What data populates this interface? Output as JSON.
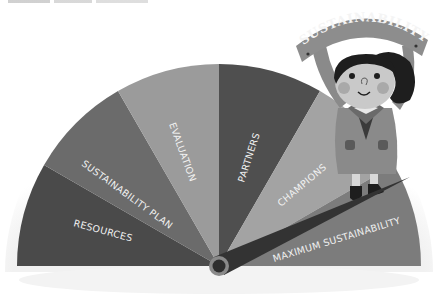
{
  "gauge": {
    "center": [
      219,
      266
    ],
    "radius": 202,
    "needle_angle_deg": 25,
    "sectors": [
      {
        "label": "RESOURCES",
        "color": "#4a4a4a"
      },
      {
        "label": "SUSTAINABILITY PLAN",
        "color": "#6b6b6b"
      },
      {
        "label": "EVALUATION",
        "color": "#9b9b9b"
      },
      {
        "label": "PARTNERS",
        "color": "#4f4f4f"
      },
      {
        "label": "CHAMPIONS",
        "color": "#a3a3a3"
      },
      {
        "label": "MAXIMUM SUSTAINABILITY",
        "color": "#7c7c7c"
      }
    ],
    "needle_color": "#333333",
    "hub_color": "#8a8a8a"
  },
  "character": {
    "banner_text": "SUSTAINABILITY",
    "banner_color": "#8d8d8d",
    "hair_color": "#1e1e1e",
    "skin_color": "#c9c9c9",
    "coat_color": "#8a8a8a"
  }
}
